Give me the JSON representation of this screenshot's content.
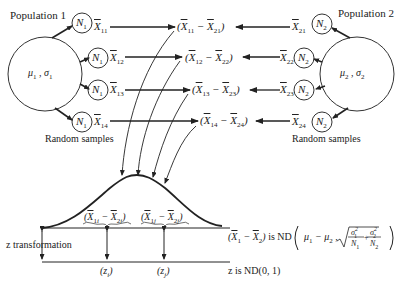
{
  "diagram": {
    "population1": {
      "title": "Population 1",
      "params": "μ₁ , σ₁",
      "sample_size": "N₁",
      "sample_means": [
        "X̄₁₁",
        "X̄₁₂",
        "X̄₁₃",
        "X̄₁₄"
      ],
      "caption": "Random samples"
    },
    "population2": {
      "title": "Population 2",
      "params": "μ₂ , σ₂",
      "sample_size": "N₂",
      "sample_means": [
        "X̄₂₁",
        "X̄₂₂",
        "X̄₂₃",
        "X̄₂₄"
      ],
      "caption": "Random samples"
    },
    "differences": [
      "(X̄₁₁ − X̄₂₁)",
      "(X̄₁₂ − X̄₂₂)",
      "(X̄₁₃ − X̄₂₃)",
      "(X̄₁₄ − X̄₂₄)"
    ],
    "curve_labels": [
      "(X̄₁ᵢ − X̄₂ᵢ)",
      "(X̄₁ⱼ − X̄₂ⱼ)"
    ],
    "z_labels": [
      "(zᵢ)",
      "(zⱼ)"
    ],
    "z_transformation_label": "z transformation",
    "distribution_statement": "(X̄₁ − X̄₂) is ND( μ₁ − μ₂ , √(σ₁²/N₁ + σ₂²/N₂) )",
    "z_statement": "z is ND(0, 1)"
  },
  "labels": {
    "pop1_title": "Population 1",
    "pop2_title": "Population 2",
    "random_samples": "Random samples",
    "z_transformation": "z transformation",
    "is_nd": "is ND",
    "z_is_nd": "z is ND(0, 1)"
  }
}
